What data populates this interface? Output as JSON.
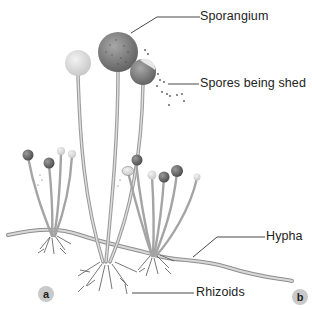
{
  "figure": {
    "labels": {
      "sporangium": "Sporangium",
      "spores": "Spores being shed",
      "hypha": "Hypha",
      "rhizoids": "Rhizoids"
    },
    "panels": {
      "a": "a",
      "b": "b"
    },
    "colors": {
      "stalk": "#b8b8b8",
      "stalk_edge": "#8a8a8a",
      "sporangium_dark": "#6a6a6a",
      "sporangium_light": "#dcdcdc",
      "badge": "#c9c9c9",
      "leader_line": "#333333"
    }
  }
}
